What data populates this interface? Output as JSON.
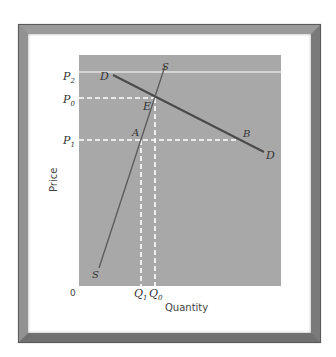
{
  "diagram": {
    "type": "supply-demand",
    "axes": {
      "x_label": "Quantity",
      "y_label": "Price",
      "origin_label": "0"
    },
    "price_labels": {
      "p2": {
        "main": "P",
        "sub": "2"
      },
      "p0": {
        "main": "P",
        "sub": "0"
      },
      "p1": {
        "main": "P",
        "sub": "1"
      }
    },
    "quantity_labels": {
      "q1": {
        "main": "Q",
        "sub": "1"
      },
      "q0": {
        "main": "Q",
        "sub": "0"
      }
    },
    "curves": {
      "demand_label_start": "D",
      "demand_label_end": "D",
      "supply_label_top": "S",
      "supply_label_bottom": "S"
    },
    "points": {
      "equilibrium": "E",
      "a": "A",
      "b": "B"
    },
    "colors": {
      "plot_bg": "#a8a8a8",
      "curve": "#4a4a4a",
      "guide": "#ffffff",
      "frame": "#888888"
    }
  }
}
